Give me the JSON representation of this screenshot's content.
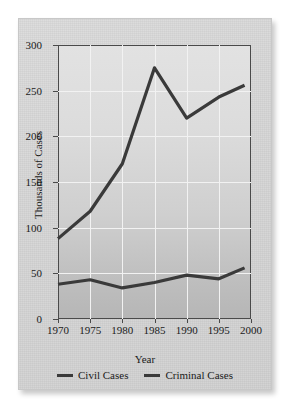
{
  "chart_data": {
    "type": "line",
    "title": "",
    "xlabel": "Year",
    "ylabel": "Thousands of Cases",
    "x": [
      1970,
      1975,
      1980,
      1985,
      1990,
      1995,
      1999
    ],
    "xlim": [
      1970,
      2000
    ],
    "ylim": [
      0,
      300
    ],
    "xticks": [
      "1970",
      "1975",
      "1980",
      "1985",
      "1990",
      "1995",
      "2000"
    ],
    "xtick_values": [
      1970,
      1975,
      1980,
      1985,
      1990,
      1995,
      2000
    ],
    "yticks": [
      "0",
      "50",
      "100",
      "150",
      "200",
      "250",
      "300"
    ],
    "ytick_values": [
      0,
      50,
      100,
      150,
      200,
      250,
      300
    ],
    "grid": true,
    "legend_position": "bottom",
    "series": [
      {
        "name": "Civil Cases",
        "color": "#3a3a3a",
        "values": [
          88,
          118,
          170,
          275,
          220,
          243,
          256
        ]
      },
      {
        "name": "Criminal Cases",
        "color": "#3a3a3a",
        "values": [
          38,
          43,
          34,
          40,
          48,
          44,
          56
        ]
      }
    ]
  },
  "legend": {
    "items": [
      {
        "label": "Civil Cases"
      },
      {
        "label": "Criminal Cases"
      }
    ]
  }
}
